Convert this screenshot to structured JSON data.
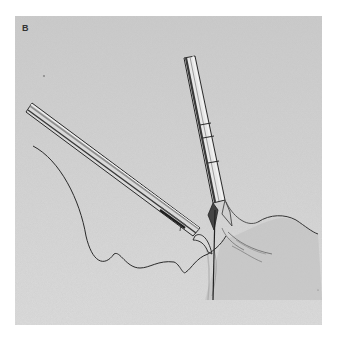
{
  "figure": {
    "panel_label": "B",
    "colors": {
      "background": "#ffffff",
      "panel": "#d2d2d2",
      "ink": "#2a2a2a",
      "highlight": "#f2f2f2"
    },
    "elements": [
      {
        "name": "needle-holder-instrument",
        "from": "upper-left",
        "to": "center"
      },
      {
        "name": "grasper-instrument",
        "from": "top-center",
        "to": "center-right"
      },
      {
        "name": "suture-thread",
        "path": "left-edge to needle tip with wavy loops"
      },
      {
        "name": "tissue-fold",
        "position": "lower-right"
      }
    ]
  }
}
